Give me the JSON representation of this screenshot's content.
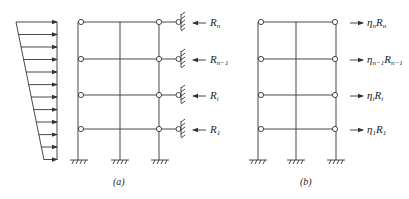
{
  "figure": {
    "panels": [
      {
        "id": "a",
        "caption": "(a)",
        "description": "Frame with lateral restraints at each floor and trapezoidal distributed lateral load",
        "load_arrow_count": 12,
        "reactions": [
          {
            "symbol": "R",
            "subscript": "n"
          },
          {
            "symbol": "R",
            "subscript": "n−1"
          },
          {
            "symbol": "R",
            "subscript": "i"
          },
          {
            "symbol": "R",
            "subscript": "1"
          }
        ]
      },
      {
        "id": "b",
        "caption": "(b)",
        "description": "Frame with applied modified reaction forces at each floor",
        "forces": [
          {
            "prefix": "η",
            "prefix_sub": "n",
            "symbol": "R",
            "subscript": "n"
          },
          {
            "prefix": "η",
            "prefix_sub": "n−1",
            "symbol": "R",
            "subscript": "n−1"
          },
          {
            "prefix": "η",
            "prefix_sub": "i",
            "symbol": "R",
            "subscript": "i"
          },
          {
            "prefix": "η",
            "prefix_sub": "1",
            "symbol": "R",
            "subscript": "1"
          }
        ]
      }
    ],
    "colors": {
      "line": "#333333",
      "background": "#ffffff"
    }
  }
}
